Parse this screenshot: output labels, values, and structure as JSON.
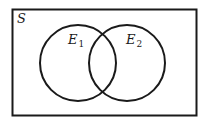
{
  "diagram": {
    "type": "venn",
    "sample_space": {
      "label": "S"
    },
    "sets": [
      {
        "label": "E",
        "subscript": "1"
      },
      {
        "label": "E",
        "subscript": "2"
      }
    ],
    "colors": {
      "stroke": "#1a1a1a",
      "background": "#ffffff"
    }
  }
}
